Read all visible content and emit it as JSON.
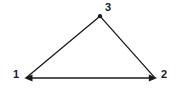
{
  "diagram": {
    "type": "triangle-with-labeled-vertices",
    "background_color": "#ffffff",
    "stroke_color": "#1a1a1a",
    "label_color": "#1a1a1a",
    "stroke_width": 1.3,
    "vertices": [
      {
        "id": "1",
        "label": "1",
        "x": 25,
        "y": 78,
        "marker": "arrowhead-left"
      },
      {
        "id": "2",
        "label": "2",
        "x": 156,
        "y": 78,
        "marker": "arrowhead-right"
      },
      {
        "id": "3",
        "label": "3",
        "x": 100,
        "y": 16,
        "marker": "dot"
      }
    ],
    "edges": [
      {
        "from": "1",
        "to": "3"
      },
      {
        "from": "3",
        "to": "2"
      },
      {
        "from": "1",
        "to": "2"
      }
    ],
    "labels": {
      "vertex_1": "1",
      "vertex_2": "2",
      "vertex_3": "3"
    }
  }
}
